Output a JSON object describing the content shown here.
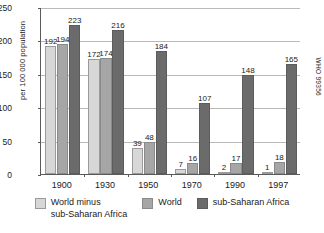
{
  "chart_data": {
    "type": "bar",
    "title": "",
    "subtitle": "",
    "xlabel": "",
    "ylabel": "per 100 000 population",
    "categories": [
      "1900",
      "1930",
      "1950",
      "1970",
      "1990",
      "1997"
    ],
    "series": [
      {
        "name": "World minus sub-Saharan Africa",
        "color": "#d7d7d7",
        "values": [
          192,
          172,
          39,
          7,
          2,
          1
        ]
      },
      {
        "name": "World",
        "color": "#a6a6a6",
        "values": [
          194,
          174,
          48,
          16,
          17,
          18
        ]
      },
      {
        "name": "sub-Saharan Africa",
        "color": "#6b6b6b",
        "values": [
          223,
          216,
          184,
          107,
          148,
          165
        ]
      }
    ],
    "ylim": [
      0,
      250
    ],
    "yticks": [
      0,
      50,
      100,
      150,
      200,
      250
    ],
    "grid": true,
    "grid_axis": "y",
    "legend_position": "bottom",
    "data_labels": true
  },
  "axes": {
    "y_title": "per 100 000 population",
    "y_tick_labels": [
      "0",
      "50",
      "100",
      "150",
      "200",
      "250"
    ],
    "x_tick_labels": [
      "1900",
      "1930",
      "1950",
      "1970",
      "1990",
      "1997"
    ]
  },
  "legend": {
    "items": [
      {
        "label": "World minus\nsub-Saharan Africa",
        "swatch_class": "s0"
      },
      {
        "label": "World",
        "swatch_class": "s1"
      },
      {
        "label": "sub-Saharan Africa",
        "swatch_class": "s2"
      }
    ]
  },
  "annotations": {
    "source_code": "WHO 99356"
  },
  "colors": {
    "series_light": "#d7d7d7",
    "series_medium": "#a6a6a6",
    "series_dark": "#6b6b6b",
    "gridline": "#b9b9b9",
    "axis": "#5a5a5a",
    "text": "#1a1a1a",
    "background": "#ffffff"
  }
}
